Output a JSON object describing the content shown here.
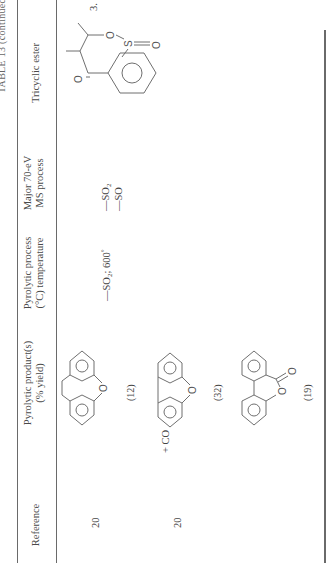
{
  "table": {
    "title": "TABLE 13 (continued)",
    "headers": {
      "ester": "Tricyclic ester",
      "ms_line1": "Major 70-eV",
      "ms_line2": "MS process",
      "pyro_line1": "Pyrolytic process",
      "pyro_line2": "(°C) temperature",
      "product_line1": "Pyrolytic product(s)",
      "product_line2": "(% yield)",
      "reference": "Reference"
    },
    "rows": [
      {
        "entry": "3.",
        "ester_structure": "cyclic sulfite ester fused to benzene ring with ketone (C=O), two methyl substituents, O–S(=O)–O",
        "ms_process_1": "—SO",
        "ms_process_1_sub": "2",
        "ms_process_2": "—SO",
        "pyrolytic_process": "—SO",
        "pyrolytic_process_sub": "2",
        "pyrolytic_temp": "; 600",
        "pyrolytic_temp_unit": "°",
        "products": [
          {
            "name": "xanthone",
            "yield": "(12)",
            "extra": "",
            "reference": "20"
          },
          {
            "name": "dibenzofuran",
            "yield": "(32)",
            "extra": "+ CO",
            "reference": "20"
          },
          {
            "name": "6H-dibenzo[b,d]pyran-6-one",
            "yield": "(19)",
            "extra": "",
            "reference": ""
          }
        ]
      }
    ]
  },
  "atoms": {
    "O": "O",
    "S": "S"
  }
}
